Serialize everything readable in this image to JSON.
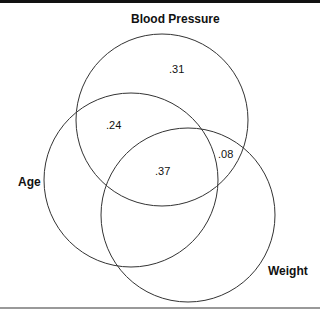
{
  "diagram": {
    "type": "venn",
    "sets": [
      {
        "name": "Blood Pressure",
        "cx": 162,
        "cy": 120,
        "r": 86
      },
      {
        "name": "Age",
        "cx": 131,
        "cy": 180,
        "r": 87
      },
      {
        "name": "Weight",
        "cx": 188,
        "cy": 215,
        "r": 87
      }
    ],
    "labels": {
      "blood_pressure": "Blood Pressure",
      "age": "Age",
      "weight": "Weight"
    },
    "values": {
      "bp_only": ".31",
      "bp_age": ".24",
      "bp_weight": ".08",
      "all_three": ".37"
    },
    "stroke_color": "#333333"
  }
}
